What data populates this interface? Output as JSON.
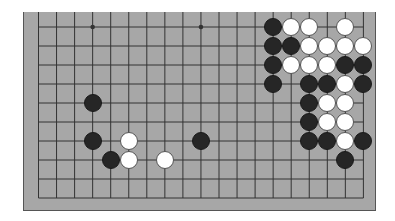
{
  "board": {
    "size": 19,
    "visible_rows": 10,
    "view": "bottom-cropped partial board, top edge cut off",
    "colors": {
      "board": "#a7a7a7",
      "line": "#333333",
      "black": "#262626",
      "white": "#ffffff"
    },
    "star_points": [
      {
        "col": 3,
        "row": 0
      },
      {
        "col": 9,
        "row": 0
      }
    ],
    "stones": [
      {
        "color": "black",
        "col": 13,
        "row": 0
      },
      {
        "color": "white",
        "col": 14,
        "row": 0
      },
      {
        "color": "white",
        "col": 15,
        "row": 0
      },
      {
        "color": "white",
        "col": 17,
        "row": 0
      },
      {
        "color": "black",
        "col": 13,
        "row": 1
      },
      {
        "color": "black",
        "col": 14,
        "row": 1
      },
      {
        "color": "white",
        "col": 15,
        "row": 1
      },
      {
        "color": "white",
        "col": 16,
        "row": 1
      },
      {
        "color": "white",
        "col": 17,
        "row": 1
      },
      {
        "color": "white",
        "col": 18,
        "row": 1
      },
      {
        "color": "black",
        "col": 13,
        "row": 2
      },
      {
        "color": "white",
        "col": 14,
        "row": 2
      },
      {
        "color": "white",
        "col": 15,
        "row": 2
      },
      {
        "color": "white",
        "col": 16,
        "row": 2
      },
      {
        "color": "black",
        "col": 17,
        "row": 2
      },
      {
        "color": "black",
        "col": 18,
        "row": 2
      },
      {
        "color": "black",
        "col": 13,
        "row": 3
      },
      {
        "color": "black",
        "col": 15,
        "row": 3
      },
      {
        "color": "black",
        "col": 16,
        "row": 3
      },
      {
        "color": "white",
        "col": 17,
        "row": 3
      },
      {
        "color": "black",
        "col": 18,
        "row": 3
      },
      {
        "color": "black",
        "col": 3,
        "row": 4
      },
      {
        "color": "black",
        "col": 15,
        "row": 4
      },
      {
        "color": "white",
        "col": 16,
        "row": 4
      },
      {
        "color": "white",
        "col": 17,
        "row": 4
      },
      {
        "color": "black",
        "col": 15,
        "row": 5
      },
      {
        "color": "white",
        "col": 16,
        "row": 5
      },
      {
        "color": "white",
        "col": 17,
        "row": 5
      },
      {
        "color": "black",
        "col": 3,
        "row": 6
      },
      {
        "color": "white",
        "col": 5,
        "row": 6
      },
      {
        "color": "black",
        "col": 9,
        "row": 6
      },
      {
        "color": "black",
        "col": 15,
        "row": 6
      },
      {
        "color": "black",
        "col": 16,
        "row": 6
      },
      {
        "color": "white",
        "col": 17,
        "row": 6
      },
      {
        "color": "black",
        "col": 18,
        "row": 6
      },
      {
        "color": "black",
        "col": 4,
        "row": 7
      },
      {
        "color": "white",
        "col": 5,
        "row": 7
      },
      {
        "color": "white",
        "col": 7,
        "row": 7
      },
      {
        "color": "black",
        "col": 17,
        "row": 7
      }
    ]
  }
}
